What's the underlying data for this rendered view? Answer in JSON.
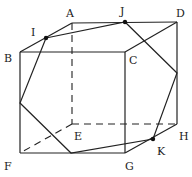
{
  "figure": {
    "type": "cube-cross-section",
    "colors": {
      "line": "#222222",
      "background": "#ffffff"
    },
    "vertices": {
      "A": {
        "label": "A",
        "x": 72,
        "y": 23,
        "lx": 66,
        "ly": 17
      },
      "B": {
        "label": "B",
        "x": 20,
        "y": 52,
        "lx": 4,
        "ly": 62
      },
      "C": {
        "label": "C",
        "x": 125,
        "y": 52,
        "lx": 129,
        "ly": 64
      },
      "D": {
        "label": "D",
        "x": 177,
        "y": 22,
        "lx": 176,
        "ly": 17
      },
      "E": {
        "label": "E",
        "x": 72,
        "y": 124,
        "lx": 74,
        "ly": 140
      },
      "F": {
        "label": "F",
        "x": 20,
        "y": 153,
        "lx": 4,
        "ly": 170
      },
      "G": {
        "label": "G",
        "x": 125,
        "y": 153,
        "lx": 125,
        "ly": 170
      },
      "H": {
        "label": "H",
        "x": 177,
        "y": 124,
        "lx": 179,
        "ly": 140
      }
    },
    "points": {
      "I": {
        "label": "I",
        "x": 46,
        "y": 38,
        "lx": 31,
        "ly": 36
      },
      "J": {
        "label": "J",
        "x": 125,
        "y": 22,
        "lx": 120,
        "ly": 15
      },
      "K": {
        "label": "K",
        "x": 153,
        "y": 139,
        "lx": 157,
        "ly": 155
      }
    },
    "section_polygon": [
      "I",
      "J",
      "P_DH",
      "K",
      "Q_FG",
      "R_BF"
    ],
    "section_extra_points": {
      "P_DH": {
        "x": 177,
        "y": 73
      },
      "Q_FG": {
        "x": 71,
        "y": 153
      },
      "R_BF": {
        "x": 20,
        "y": 103
      }
    }
  }
}
